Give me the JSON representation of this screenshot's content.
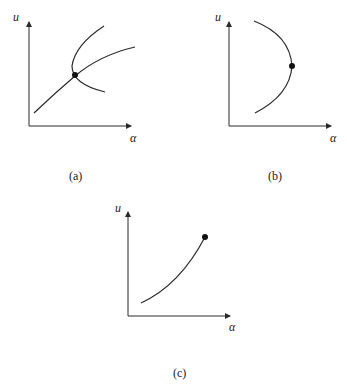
{
  "panels": [
    {
      "id": "a",
      "caption": "(a)",
      "ylabel": "u",
      "xlabel": "α",
      "description": "Transcritical/pitchfork-like crossing: a monotone branch crossed by a fold-shaped branch at a marked point"
    },
    {
      "id": "b",
      "caption": "(b)",
      "ylabel": "u",
      "xlabel": "α",
      "description": "Fold (turning point): curve opening to the left with marked point at the turning point"
    },
    {
      "id": "c",
      "caption": "(c)",
      "ylabel": "u",
      "xlabel": "α",
      "description": "Increasing curve ending at a marked endpoint"
    }
  ],
  "colors": {
    "ink": "#2a2a2a",
    "background": "#ffffff"
  }
}
